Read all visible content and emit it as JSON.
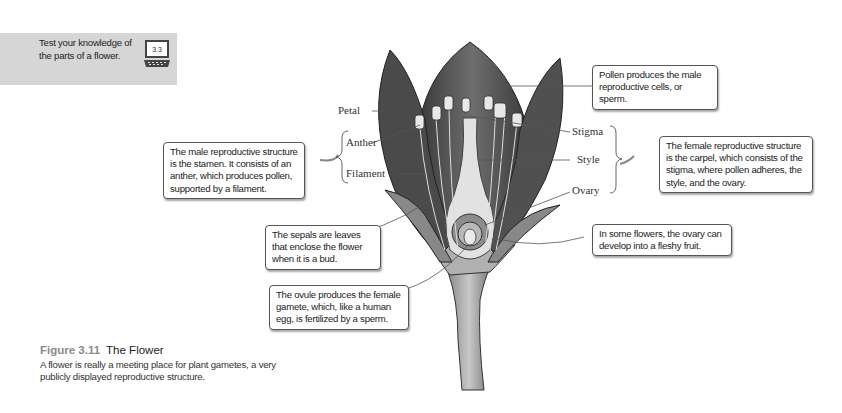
{
  "quiz": {
    "text": "Test your knowledge of the parts of a flower.",
    "icon_label": "3.3",
    "icon": "computer-icon",
    "background": "#d6d6d6"
  },
  "labels": {
    "petal": "Petal",
    "anther": "Anther",
    "filament": "Filament",
    "stigma": "Stigma",
    "style": "Style",
    "ovary": "Ovary"
  },
  "callouts": {
    "stamen": "The male reproductive structure is the stamen. It consists of an anther, which produces pollen, supported by a filament.",
    "pollen": "Pollen produces the male reproductive cells, or sperm.",
    "carpel": "The female reproductive structure is the carpel, which consists of the stigma, where pollen adheres, the style, and the ovary.",
    "fruit": "In some flowers, the ovary can develop into a fleshy fruit.",
    "sepals": "The sepals are leaves that enclose the flower when it is a bud.",
    "ovule": "The ovule produces the female gamete, which, like a human egg, is fertilized by a sperm."
  },
  "caption": {
    "figure_number": "Figure 3.11",
    "title": "The Flower",
    "body": "A flower is really a meeting place for plant gametes, a very publicly displayed reproductive structure."
  }
}
